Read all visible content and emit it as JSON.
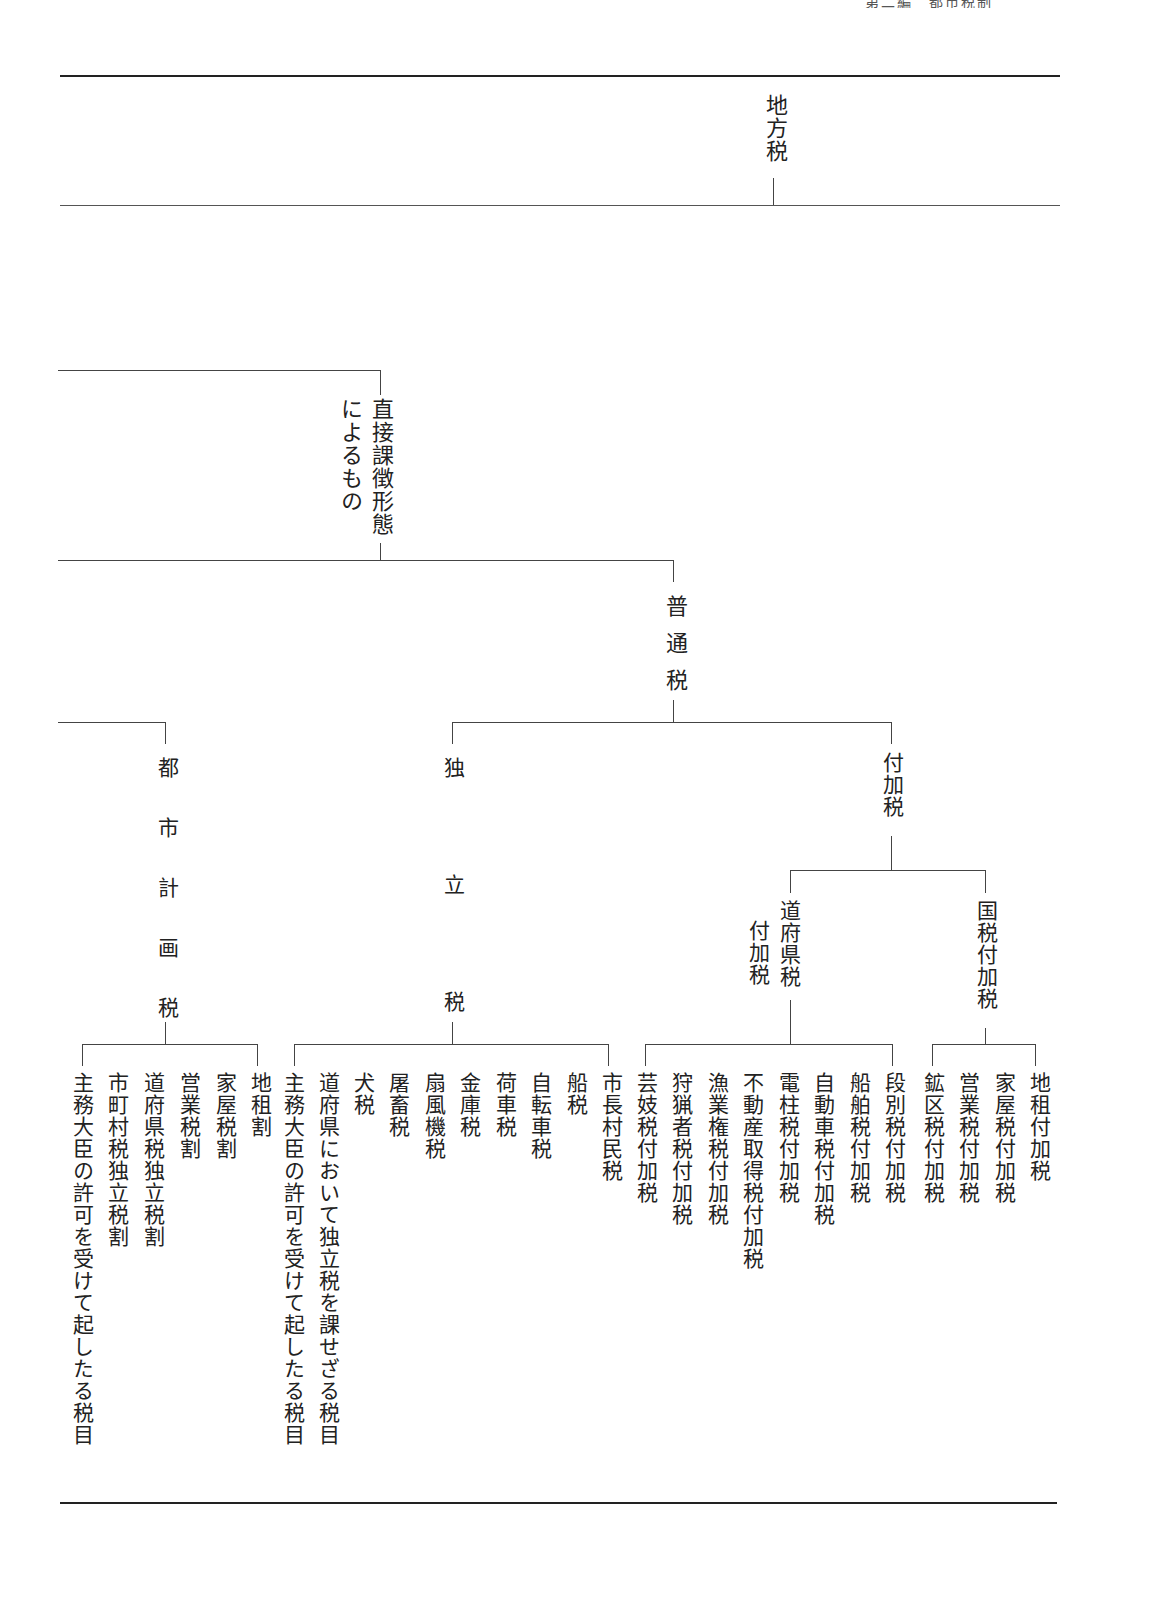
{
  "page_header": "第二編　都市税制",
  "diagram": {
    "root": "地方税",
    "level1": {
      "label_line1": "直接課徴形態",
      "label_line2": "によるもの"
    },
    "level2": {
      "label": "普通税"
    },
    "branches": {
      "toshi_keikaku": {
        "label": "都市計画税",
        "items": [
          "地租割",
          "家屋税割",
          "営業税割",
          "道府県税独立税割",
          "市町村税独立税割",
          "主務大臣の許可を受けて起したる税目"
        ]
      },
      "dokuritsu": {
        "label": "独立税",
        "items": [
          "市長村民税",
          "船税",
          "自転車税",
          "荷車税",
          "金庫税",
          "扇風機税",
          "屠畜税",
          "犬税",
          "道府県において独立税を課せざる税目",
          "主務大臣の許可を受けて起したる税目"
        ]
      },
      "fukazei": {
        "label": "付加税",
        "dofuken": {
          "label_line1": "道府県税",
          "label_line2": "付加税",
          "items": [
            "段別税付加税",
            "船舶税付加税",
            "自動車税付加税",
            "電柱税付加税",
            "不動産取得税付加税",
            "漁業権税付加税",
            "狩猟者税付加税",
            "芸妓税付加税"
          ]
        },
        "kokuzei": {
          "label": "国税付加税",
          "items": [
            "地租付加税",
            "家屋税付加税",
            "営業税付加税",
            "鉱区税付加税"
          ]
        }
      }
    }
  }
}
